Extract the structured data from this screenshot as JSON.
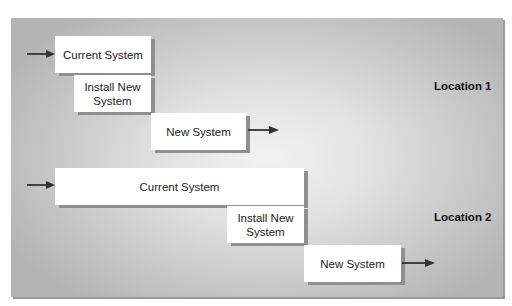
{
  "diagram": {
    "type": "phased conversion",
    "locations": [
      {
        "label": "Location 1",
        "current_system": "Current System",
        "install": "Install New\nSystem",
        "install_line1": "Install New",
        "install_line2": "System",
        "new_system": "New System"
      },
      {
        "label": "Location 2",
        "current_system": "Current System",
        "install": "Install New\nSystem",
        "install_line1": "Install New",
        "install_line2": "System",
        "new_system": "New System"
      }
    ],
    "colors": {
      "box_fill": "#ffffff",
      "box_shadow": "#8f8f8f",
      "panel_center": "#f2f2f2",
      "panel_edge": "#b4b4b4",
      "arrow": "#333333"
    }
  }
}
